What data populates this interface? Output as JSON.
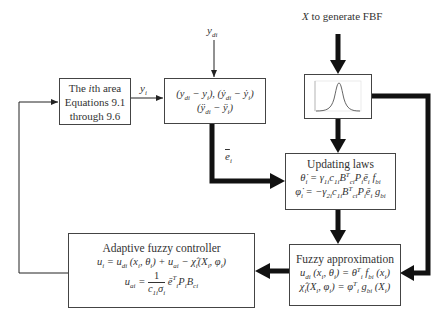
{
  "diagram": {
    "inputs": {
      "ydi_label": "y_di",
      "fbf_input_label": "X to generate FBF"
    },
    "signals": {
      "yi_label": "y_i",
      "ei_label": "ē_i"
    },
    "area_box": {
      "line1": "The ith area",
      "line2": "Equations 9.1",
      "line3": "through 9.6"
    },
    "error_box": {
      "line1": "(y_di − y_i), (ẏ_di − ẏ_i)",
      "line2": "(ÿ_di − ÿ_i)"
    },
    "fbf_box": {
      "content": "gaussian-membership-plot"
    },
    "updating_box": {
      "title": "Updating laws",
      "eq1": "θ̇_i = γ_1i c_1i B_ci^T P_i ē_i f_bi",
      "eq2": "φ̇_i = −γ_2i c_1i B_ci^T P_i ē_i g_bi"
    },
    "fuzzy_approx_box": {
      "title": "Fuzzy approximation",
      "eq1": "u_di (x_i, θ_i) = θ_i^T f_bi (x_i)",
      "eq2": "χ̂_i(X_i, φ_i) = φ_i^T g_bi (X_i)"
    },
    "controller_box": {
      "title": "Adaptive fuzzy controller",
      "eq1": "u_i = u_di (x_i, θ_i) + u_ai − χ̂_i(X_i, φ_i)",
      "eq2": "u_ai = (1 / (c_1i σ_i)) ē_i^T P_i B_ci"
    }
  }
}
